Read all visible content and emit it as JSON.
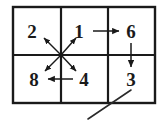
{
  "figure": {
    "grid": {
      "rows": 2,
      "columns": 3,
      "outer_border_color": "#1a1a1a",
      "inner_line_color": "#1a1a1a",
      "background_color": "#ffffff",
      "left": 13,
      "top": 7,
      "right": 155,
      "bottom": 103,
      "v_divider_1_x": 61,
      "v_divider_2_x": 108,
      "h_divider_y": 55
    },
    "cells": [
      {
        "id": "cell-r1c1",
        "row": 1,
        "col": 1,
        "label": "2",
        "cx": 32,
        "cy": 31
      },
      {
        "id": "cell-r1c2",
        "row": 1,
        "col": 2,
        "label": "1",
        "cx": 79,
        "cy": 31
      },
      {
        "id": "cell-r1c3",
        "row": 1,
        "col": 3,
        "label": "6",
        "cx": 131,
        "cy": 31
      },
      {
        "id": "cell-r2c1",
        "row": 2,
        "col": 1,
        "label": "8",
        "cx": 34,
        "cy": 79
      },
      {
        "id": "cell-r2c2",
        "row": 2,
        "col": 2,
        "label": "4",
        "cx": 84,
        "cy": 79
      },
      {
        "id": "cell-r2c3",
        "row": 2,
        "col": 3,
        "label": "3",
        "cx": 131,
        "cy": 79
      }
    ],
    "arrows": [
      {
        "id": "arrow-one-to-six",
        "name": "arrow-1-to-6",
        "from_label": "1",
        "to_label": "6",
        "direction": "right",
        "x1": 93,
        "y1": 31,
        "x2": 119,
        "y2": 31
      },
      {
        "id": "arrow-six-to-three",
        "name": "arrow-6-to-3",
        "from_label": "6",
        "to_label": "3",
        "direction": "down",
        "x1": 131,
        "y1": 43,
        "x2": 131,
        "y2": 67
      },
      {
        "id": "arrow-four-to-eight",
        "name": "arrow-4-to-8",
        "from_label": "4",
        "to_label": "8",
        "direction": "left",
        "x1": 73,
        "y1": 79,
        "x2": 48,
        "y2": 79
      },
      {
        "id": "arrow-center-to-one",
        "name": "arrow-center-to-1",
        "from_label": "center",
        "to_label": "1",
        "direction": "up-right",
        "x1": 61,
        "y1": 55,
        "x2": 76,
        "y2": 38
      },
      {
        "id": "arrow-center-to-four",
        "name": "arrow-center-to-4",
        "from_label": "center",
        "to_label": "4",
        "direction": "down-right",
        "x1": 61,
        "y1": 55,
        "x2": 76,
        "y2": 71
      },
      {
        "id": "arrow-center-to-two",
        "name": "arrow-center-to-2",
        "from_label": "center",
        "to_label": "2",
        "direction": "up-left",
        "x1": 61,
        "y1": 55,
        "x2": 44,
        "y2": 38
      },
      {
        "id": "arrow-center-to-eight",
        "name": "arrow-center-to-8",
        "from_label": "center",
        "to_label": "8",
        "direction": "down-left",
        "x1": 61,
        "y1": 55,
        "x2": 45,
        "y2": 71
      }
    ],
    "marks": [
      {
        "id": "diagonal-stroke-lower-right",
        "name": "diagonal-stroke",
        "description": "diagonal pencil stroke crossing the lower border beneath cell 3",
        "x1": 131,
        "y1": 90,
        "x2": 88,
        "y2": 119
      }
    ],
    "stroke": {
      "border_width": 2.4,
      "divider_width": 2.2,
      "arrow_width": 1.5,
      "mark_width": 1.6
    }
  }
}
